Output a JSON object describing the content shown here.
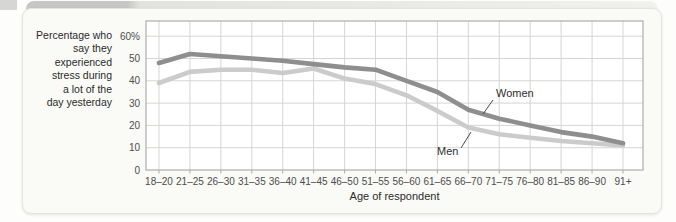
{
  "page": {
    "background_color": "#fdfdfb",
    "card_color": "#fafaf7",
    "bottom_strip_color": "#d9d9d6",
    "back_tab_color": "#c6c6c4"
  },
  "chart_data": {
    "type": "line",
    "title": "",
    "xlabel": "Age of respondent",
    "ylabel": "Percentage who say they experienced stress during a lot of the day yesterday",
    "ylabel_lines": [
      "Percentage who",
      "say they",
      "experienced",
      "stress during",
      "a lot of the",
      "day yesterday"
    ],
    "categories": [
      "18–20",
      "21–25",
      "26–30",
      "31–35",
      "36–40",
      "41–45",
      "46–50",
      "51–55",
      "56–60",
      "61–65",
      "66–70",
      "71–75",
      "76–80",
      "81–85",
      "86–90",
      "91+"
    ],
    "series": [
      {
        "name": "Women",
        "color": "#8e8e8e",
        "values": [
          48,
          52,
          51,
          50,
          49,
          47.5,
          46,
          45,
          40,
          35,
          27,
          23,
          20,
          17,
          15,
          12
        ]
      },
      {
        "name": "Men",
        "color": "#cbcbcb",
        "values": [
          39,
          44,
          45,
          45,
          43.5,
          45.5,
          41,
          38.5,
          33.5,
          26.5,
          19,
          16,
          14.5,
          13,
          12,
          11
        ]
      }
    ],
    "yticks": [
      {
        "label": "60%",
        "value": 60
      },
      {
        "label": "50",
        "value": 50
      },
      {
        "label": "40",
        "value": 40
      },
      {
        "label": "30",
        "value": 30
      },
      {
        "label": "20",
        "value": 20
      },
      {
        "label": "10",
        "value": 10
      },
      {
        "label": "0",
        "value": 0
      }
    ],
    "ylim": [
      0,
      66
    ],
    "grid": true,
    "legend": "inline-annotations",
    "text_color": "#4d4d4d",
    "axis_title_color": "#2b2b2b",
    "gridline_color": "#d5d5d3",
    "frame_color": "#adadab"
  }
}
